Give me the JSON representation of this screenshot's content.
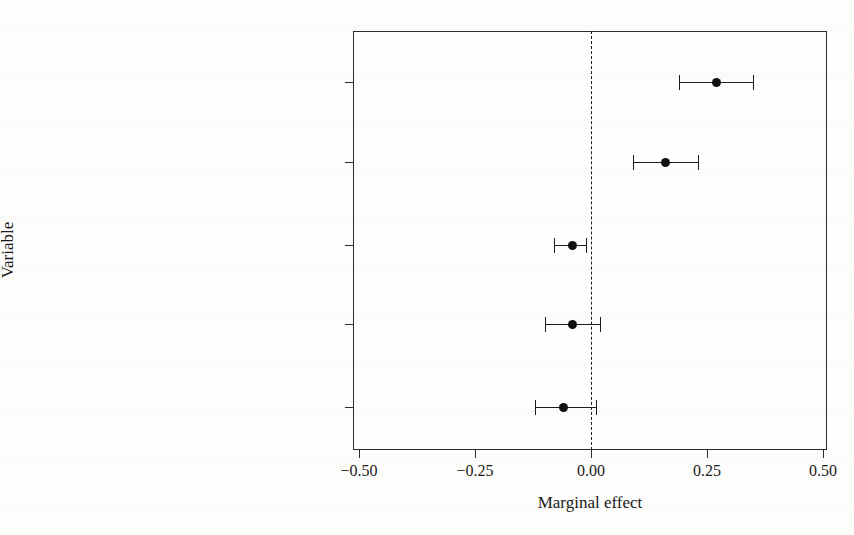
{
  "figure": {
    "background_color": "#fdfdfb",
    "ink_color": "#1c1c1c"
  },
  "chart_data": {
    "type": "scatter",
    "subtype": "coefficient-plot-with-error-bars",
    "title": "",
    "xlabel": "Marginal effect",
    "ylabel": "Variable",
    "xlim": [
      -0.58,
      0.53
    ],
    "ylim": [
      0,
      6
    ],
    "grid": false,
    "legend": null,
    "reference_line": {
      "orientation": "vertical",
      "value": 0.0,
      "style": "dashed"
    },
    "xticks": [
      -0.5,
      -0.25,
      0.0,
      0.25,
      0.5
    ],
    "xticklabels": [
      "-0.50",
      "-0.25",
      "0.00",
      "0.25",
      "0.50"
    ],
    "categories": [
      "High stake policy area",
      "Low stake policy area",
      "Exclusion of issue areas from CDA",
      "Constitutional reform 1994",
      "Bicameral commitee for DNUs"
    ],
    "values": [
      0.27,
      0.16,
      -0.04,
      -0.04,
      -0.06
    ],
    "ci_low": [
      0.19,
      0.09,
      -0.08,
      -0.1,
      -0.12
    ],
    "ci_high": [
      0.35,
      0.23,
      -0.01,
      0.02,
      0.01
    ],
    "points": [
      {
        "label": "High stake policy area",
        "estimate": 0.27,
        "ci_low": 0.19,
        "ci_high": 0.35,
        "significant": true
      },
      {
        "label": "Low stake policy area",
        "estimate": 0.16,
        "ci_low": 0.09,
        "ci_high": 0.23,
        "significant": true
      },
      {
        "label": "Exclusion of issue areas from CDA",
        "estimate": -0.04,
        "ci_low": -0.08,
        "ci_high": -0.01,
        "significant": true
      },
      {
        "label": "Constitutional reform 1994",
        "estimate": -0.04,
        "ci_low": -0.1,
        "ci_high": 0.02,
        "significant": false
      },
      {
        "label": "Bicameral commitee for DNUs",
        "estimate": -0.06,
        "ci_low": -0.12,
        "ci_high": 0.01,
        "significant": false
      }
    ]
  }
}
